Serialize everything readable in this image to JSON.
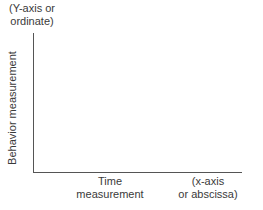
{
  "diagram": {
    "y_axis_note": [
      "(Y-axis or",
      "ordinate)"
    ],
    "y_axis_label": "Behavior measurement",
    "x_axis_label": [
      "Time",
      "measurement"
    ],
    "x_axis_note": [
      "(x-axis",
      "or abscissa)"
    ]
  },
  "chart_data": {
    "type": "line",
    "title": "",
    "xlabel": "Time measurement",
    "ylabel": "Behavior measurement",
    "annotations": [
      "(Y-axis or ordinate)",
      "(x-axis or abscissa)"
    ],
    "series": [],
    "grid": false
  }
}
